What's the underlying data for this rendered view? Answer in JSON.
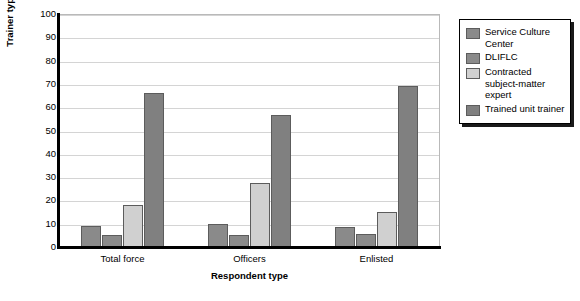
{
  "chart_data": {
    "type": "bar",
    "title": "",
    "xlabel": "Respondent type",
    "ylabel": "Trainer type (%)",
    "categories": [
      "Total force",
      "Officers",
      "Enlisted"
    ],
    "series": [
      {
        "name": "Service Culture Center",
        "color": "#8a8a8a",
        "values": [
          9,
          10,
          8.5
        ]
      },
      {
        "name": "DLIFLC",
        "color": "#8a8a8a",
        "values": [
          5,
          5,
          5.5
        ]
      },
      {
        "name": "Contracted subject-matter expert",
        "color": "#d0d0d0",
        "values": [
          18,
          27.5,
          15
        ]
      },
      {
        "name": "Trained unit trainer",
        "color": "#808080",
        "values": [
          66,
          56.5,
          69
        ]
      }
    ],
    "ylim": [
      0,
      100
    ],
    "yticks": [
      0,
      10,
      20,
      30,
      40,
      50,
      60,
      70,
      80,
      90,
      100
    ],
    "ytick_labels": [
      "0",
      "10",
      "20",
      "30",
      "40",
      "50",
      "60",
      "70",
      "80",
      "90",
      "100"
    ],
    "grid": true,
    "legend_position": "right",
    "legend_entries": [
      "Service Culture Center",
      "DLIFLC",
      "Contracted subject-matter expert",
      "Trained unit trainer"
    ]
  }
}
